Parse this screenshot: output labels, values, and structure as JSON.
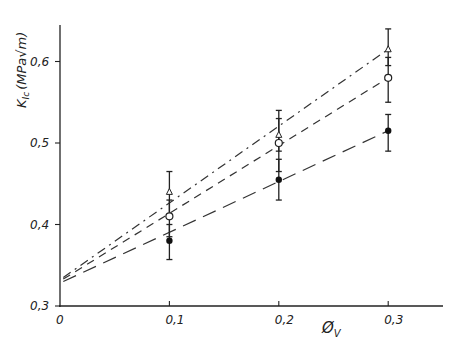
{
  "chart_data": {
    "type": "scatter",
    "title": "",
    "xlabel": "Ø_V",
    "ylabel": "K_Ic (MPa√m)",
    "xlim": [
      0,
      0.35
    ],
    "ylim": [
      0.3,
      0.65
    ],
    "x_ticks": [
      "0",
      "0,1",
      "0,2",
      "0,3"
    ],
    "y_ticks": [
      "0,3",
      "0,4",
      "0,5",
      "0,6"
    ],
    "grid": false,
    "legend": null,
    "x": [
      0.1,
      0.2,
      0.3
    ],
    "series": [
      {
        "name": "open triangle",
        "marker": "triangle-open",
        "line": "dash-dot",
        "values": [
          0.44,
          0.51,
          0.615
        ],
        "err_low": [
          0.41,
          0.49,
          0.595
        ],
        "err_high": [
          0.465,
          0.54,
          0.64
        ],
        "fit_intercept": 0.335
      },
      {
        "name": "open circle",
        "marker": "circle-open",
        "line": "dashed",
        "values": [
          0.41,
          0.5,
          0.58
        ],
        "err_low": [
          0.385,
          0.465,
          0.55
        ],
        "err_high": [
          0.43,
          0.53,
          0.605
        ],
        "fit_intercept": 0.333
      },
      {
        "name": "filled circle",
        "marker": "circle-filled",
        "line": "long-dash",
        "values": [
          0.38,
          0.455,
          0.515
        ],
        "err_low": [
          0.357,
          0.43,
          0.49
        ],
        "err_high": [
          0.4,
          0.48,
          0.535
        ],
        "fit_intercept": 0.33
      }
    ]
  },
  "axes": {
    "xlabel_main": "Ø",
    "xlabel_sub": "V",
    "ylabel": "K",
    "ylabel_sub": "Ic",
    "ylabel_units": "(MPa√m)"
  }
}
